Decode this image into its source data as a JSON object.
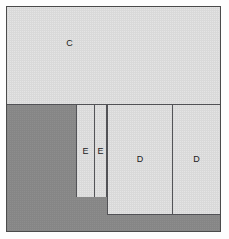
{
  "figure": {
    "title": "",
    "background_color": "#fdfdfd",
    "frame_color": "#4a4a4a",
    "light_fill": "#e4e4e4",
    "dark_fill": "#8d8d8d",
    "line_color": "#55565a",
    "label_color": "#222222"
  },
  "regions": [
    {
      "id": "C",
      "label": "C",
      "fill": "light",
      "note": "top full-width band"
    },
    {
      "id": "BG",
      "label": "",
      "fill": "dark",
      "note": "lower-left dark background"
    },
    {
      "id": "E1",
      "label": "E",
      "fill": "light",
      "note": "narrow left column"
    },
    {
      "id": "E2",
      "label": "E",
      "fill": "light",
      "note": "narrow right column"
    },
    {
      "id": "D1",
      "label": "D",
      "fill": "light",
      "note": "large left block"
    },
    {
      "id": "D2",
      "label": "D",
      "fill": "light",
      "note": "large right block"
    }
  ],
  "labels": {
    "c": "C",
    "e1": "E",
    "e2": "E",
    "d1": "D",
    "d2": "D"
  }
}
